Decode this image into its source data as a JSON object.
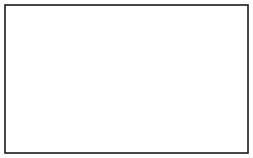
{
  "figure": {
    "canvas": {
      "width": 253,
      "height": 158,
      "background": "#ffffff"
    },
    "frame": {
      "name": "border-frame",
      "x": 5,
      "y": 5,
      "width": 243,
      "height": 148,
      "stroke": "#1a1a1a",
      "stroke_width": 1.6
    },
    "center": {
      "x": 127,
      "y": 77
    },
    "core": {
      "label": "central-core-blob",
      "rx": 33,
      "ry": 25,
      "stroke": "#a8a8a8",
      "fill": "#ffffff"
    },
    "rays": {
      "label": "radiating-field-lines",
      "count": 24,
      "stroke": "#111111",
      "description": "straight lines radiating outward from the core to the frame edges and corners"
    },
    "arrowheads": {
      "label": "inward-pointing-arrowheads",
      "count": 24,
      "fill": "#000000",
      "direction": "inward",
      "description": "solid triangular arrowheads ringing the central core, all pointing toward the center"
    },
    "contours": {
      "label": "concentric-shell-contours",
      "count": 5,
      "stroke": "#111111",
      "description": "nested ellipse contours surrounding the core, denser on the left side"
    },
    "disk": {
      "label": "equatorial-disk",
      "rx": 88,
      "ry": 27,
      "stroke": "#111111"
    },
    "wings": {
      "label": "lateral-wing-tabs",
      "count": 2,
      "sides": [
        "left",
        "right"
      ],
      "stroke": "#111111",
      "fill": "#ffffff"
    },
    "colors": {
      "ink": "#111111",
      "frame": "#1a1a1a",
      "faint": "#8d8d8d",
      "paper": "#ffffff"
    }
  }
}
